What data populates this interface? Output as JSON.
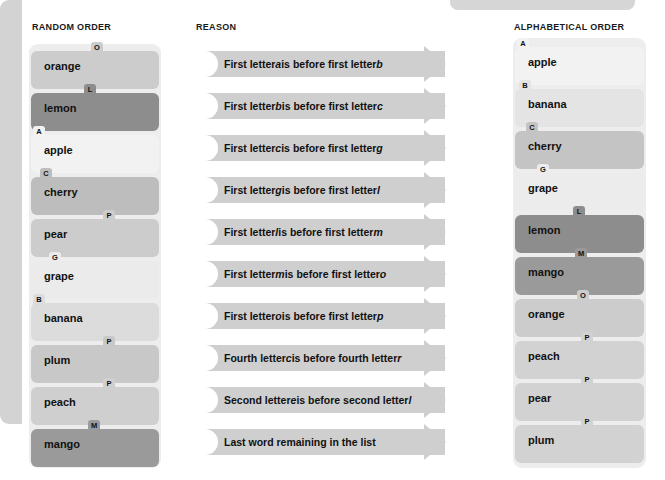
{
  "headers": {
    "left": "RANDOM ORDER",
    "middle": "REASON",
    "right": "ALPHABETICAL ORDER"
  },
  "colors": {
    "page_background": "#ffffff",
    "panel": "#ededed",
    "arrow": "#cfcfcf",
    "mid_panel_edge": "#d3d3d3",
    "tab": "#bdbdbd",
    "text": "#111111",
    "shade_lightest": "#f2f2f2",
    "shade_light": "#e2e2e2",
    "shade_mid": "#cfcfcf",
    "shade_dark": "#b4b4b4",
    "shade_darkest": "#8d8d8d"
  },
  "random_order": {
    "title": "RANDOM ORDER",
    "items": [
      {
        "label": "orange",
        "tab": "O",
        "tab_pos": 60,
        "shade": "#cccccc"
      },
      {
        "label": "lemon",
        "tab": "L",
        "tab_pos": 53,
        "shade": "#8d8d8d"
      },
      {
        "label": "apple",
        "tab": "A",
        "tab_pos": 2,
        "shade": "#f2f2f2"
      },
      {
        "label": "cherry",
        "tab": "C",
        "tab_pos": 9,
        "shade": "#bdbdbd"
      },
      {
        "label": "pear",
        "tab": "P",
        "tab_pos": 72,
        "shade": "#cccccc"
      },
      {
        "label": "grape",
        "tab": "G",
        "tab_pos": 18,
        "shade": "#ebebeb"
      },
      {
        "label": "banana",
        "tab": "B",
        "tab_pos": 2,
        "shade": "#dcdcdc"
      },
      {
        "label": "plum",
        "tab": "P",
        "tab_pos": 72,
        "shade": "#c8c8c8"
      },
      {
        "label": "peach",
        "tab": "P",
        "tab_pos": 72,
        "shade": "#cfcfcf"
      },
      {
        "label": "mango",
        "tab": "M",
        "tab_pos": 57,
        "shade": "#9a9a9a"
      }
    ]
  },
  "alphabetical_order": {
    "title": "ALPHABETICAL ORDER",
    "items": [
      {
        "label": "apple",
        "tab": "A",
        "tab_pos": 2,
        "shade": "#f2f2f2"
      },
      {
        "label": "banana",
        "tab": "B",
        "tab_pos": 4,
        "shade": "#e4e4e4"
      },
      {
        "label": "cherry",
        "tab": "C",
        "tab_pos": 11,
        "shade": "#c4c4c4"
      },
      {
        "label": "grape",
        "tab": "G",
        "tab_pos": 22,
        "shade": "#ececec"
      },
      {
        "label": "lemon",
        "tab": "L",
        "tab_pos": 58,
        "shade": "#8d8d8d"
      },
      {
        "label": "mango",
        "tab": "M",
        "tab_pos": 60,
        "shade": "#9a9a9a"
      },
      {
        "label": "orange",
        "tab": "O",
        "tab_pos": 62,
        "shade": "#cccccc"
      },
      {
        "label": "peach",
        "tab": "P",
        "tab_pos": 66,
        "shade": "#d2d2d2"
      },
      {
        "label": "pear",
        "tab": "P",
        "tab_pos": 66,
        "shade": "#d2d2d2"
      },
      {
        "label": "plum",
        "tab": "P",
        "tab_pos": 66,
        "shade": "#d2d2d2"
      }
    ]
  },
  "reasons": {
    "title": "REASON",
    "items": [
      {
        "prefix": "First letter ",
        "a": "a",
        "mid": " is before first letter ",
        "b": "b"
      },
      {
        "prefix": "First letter ",
        "a": "b",
        "mid": " is before first letter ",
        "b": "c"
      },
      {
        "prefix": "First letter ",
        "a": "c",
        "mid": " is before first letter ",
        "b": "g"
      },
      {
        "prefix": "First letter ",
        "a": "g",
        "mid": " is before first letter ",
        "b": "l"
      },
      {
        "prefix": "First letter ",
        "a": "l",
        "mid": " is before first letter ",
        "b": "m"
      },
      {
        "prefix": "First letter ",
        "a": "m",
        "mid": " is before first letter ",
        "b": "o"
      },
      {
        "prefix": "First letter ",
        "a": "o",
        "mid": " is before first letter ",
        "b": "p"
      },
      {
        "prefix": "Fourth letter ",
        "a": "c",
        "mid": " is before fourth letter ",
        "b": "r"
      },
      {
        "prefix": "Second letter ",
        "a": "e",
        "mid": " is before second letter ",
        "b": "l"
      },
      {
        "prefix": "Last word remaining in the list",
        "a": "",
        "mid": "",
        "b": ""
      }
    ]
  }
}
